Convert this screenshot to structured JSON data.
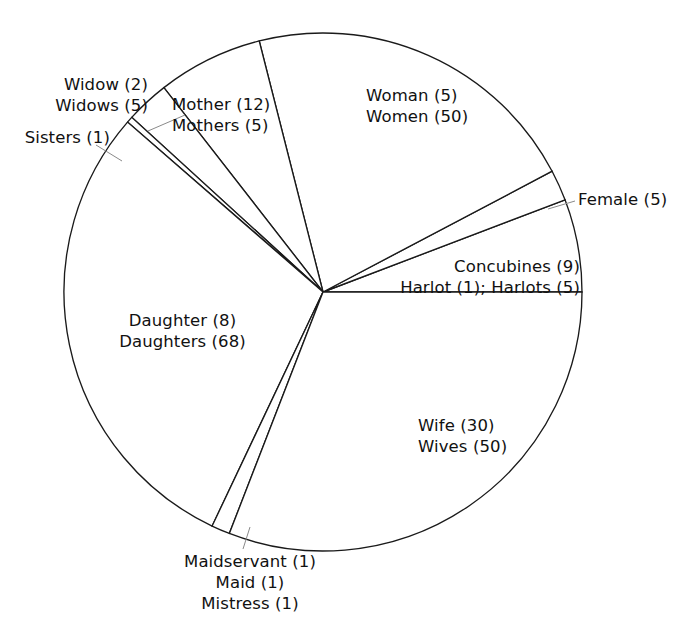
{
  "chart_data": {
    "type": "pie",
    "title": "",
    "subtitle": "",
    "xlabel": "",
    "ylabel": "",
    "legend_position": "none",
    "grid": false,
    "total": 259,
    "units": "occurrences",
    "center": {
      "x": 323,
      "y": 292
    },
    "radius": 259,
    "start_angle_deg": 0,
    "direction": "counterclockwise",
    "categories": [
      "Harlot (1); Harlots (5) + Concubines (9)",
      "Female (5)",
      "Woman (5) / Women (50)",
      "Mother (12) / Mothers (5)",
      "Widow (2) / Widows (5)",
      "Sisters (1)",
      "Daughter (8) / Daughters (68)",
      "Maidservant (1) / Maid (1) / Mistress (1)",
      "Wife (30) / Wives (50)"
    ],
    "values": [
      15,
      5,
      55,
      17,
      7,
      1,
      76,
      3,
      80
    ],
    "slices": [
      {
        "id": "concubines-harlots",
        "label_lines": [
          "Concubines (9)",
          "Harlot (1); Harlots (5)"
        ],
        "terms": [
          {
            "term": "Concubines",
            "count": 9
          },
          {
            "term": "Harlot",
            "count": 1
          },
          {
            "term": "Harlots",
            "count": 5
          }
        ],
        "value": 15,
        "percent": 5.8,
        "start_deg": 0,
        "end_deg": 20.85,
        "label_placement": "inside-right"
      },
      {
        "id": "female",
        "label_lines": [
          "Female (5)"
        ],
        "terms": [
          {
            "term": "Female",
            "count": 5
          }
        ],
        "value": 5,
        "percent": 1.9,
        "start_deg": 20.85,
        "end_deg": 27.8,
        "label_placement": "outside-right-with-leader"
      },
      {
        "id": "woman-women",
        "label_lines": [
          "Woman (5)",
          "Women (50)"
        ],
        "terms": [
          {
            "term": "Woman",
            "count": 5
          },
          {
            "term": "Women",
            "count": 50
          }
        ],
        "value": 55,
        "percent": 21.2,
        "start_deg": 27.8,
        "end_deg": 104.25,
        "label_placement": "inside-upper-right"
      },
      {
        "id": "mother-mothers",
        "label_lines": [
          "Mother (12)",
          "Mothers (5)"
        ],
        "terms": [
          {
            "term": "Mother",
            "count": 12
          },
          {
            "term": "Mothers",
            "count": 5
          }
        ],
        "value": 17,
        "percent": 6.6,
        "start_deg": 104.25,
        "end_deg": 127.9,
        "label_placement": "inside-upper"
      },
      {
        "id": "widow-widows",
        "label_lines": [
          "Widow (2)",
          "Widows (5)"
        ],
        "terms": [
          {
            "term": "Widow",
            "count": 2
          },
          {
            "term": "Widows",
            "count": 5
          }
        ],
        "value": 7,
        "percent": 2.7,
        "start_deg": 127.9,
        "end_deg": 137.6,
        "label_placement": "outside-upper-left-with-leader"
      },
      {
        "id": "sisters",
        "label_lines": [
          "Sisters (1)"
        ],
        "terms": [
          {
            "term": "Sisters",
            "count": 1
          }
        ],
        "value": 1,
        "percent": 0.4,
        "start_deg": 137.6,
        "end_deg": 139.0,
        "label_placement": "outside-left-with-leader"
      },
      {
        "id": "daughter-daughters",
        "label_lines": [
          "Daughter (8)",
          "Daughters (68)"
        ],
        "terms": [
          {
            "term": "Daughter",
            "count": 8
          },
          {
            "term": "Daughters",
            "count": 68
          }
        ],
        "value": 76,
        "percent": 29.3,
        "start_deg": 139.0,
        "end_deg": 244.65,
        "label_placement": "inside-left"
      },
      {
        "id": "maidservant-maid-mistress",
        "label_lines": [
          "Maidservant (1)",
          "Maid (1)",
          "Mistress (1)"
        ],
        "terms": [
          {
            "term": "Maidservant",
            "count": 1
          },
          {
            "term": "Maid",
            "count": 1
          },
          {
            "term": "Mistress",
            "count": 1
          }
        ],
        "value": 3,
        "percent": 1.2,
        "start_deg": 244.65,
        "end_deg": 248.8,
        "label_placement": "outside-bottom-with-leader"
      },
      {
        "id": "wife-wives",
        "label_lines": [
          "Wife (30)",
          "Wives (50)"
        ],
        "terms": [
          {
            "term": "Wife",
            "count": 30
          },
          {
            "term": "Wives",
            "count": 50
          }
        ],
        "value": 80,
        "percent": 30.9,
        "start_deg": 248.8,
        "end_deg": 360,
        "label_placement": "inside-lower-right"
      }
    ],
    "colors": {
      "slice_fill": "#ffffff",
      "slice_stroke": "#1a1a1a",
      "leader_line": "#8a8a8a",
      "label_text": "#111111",
      "background": "#ffffff"
    }
  },
  "labels": {
    "widow": {
      "line1": "Widow (2)",
      "line2": "Widows (5)"
    },
    "sisters": {
      "line1": "Sisters (1)"
    },
    "mother": {
      "line1": "Mother (12)",
      "line2": "Mothers (5)"
    },
    "woman": {
      "line1": "Woman (5)",
      "line2": "Women (50)"
    },
    "female": {
      "line1": "Female (5)"
    },
    "concubines": {
      "line1": "Concubines (9)",
      "line2": "Harlot (1); Harlots (5)"
    },
    "wife": {
      "line1": "Wife (30)",
      "line2": "Wives (50)"
    },
    "daughter": {
      "line1": "Daughter (8)",
      "line2": "Daughters (68)"
    },
    "maid": {
      "line1": "Maidservant (1)",
      "line2": "Maid (1)",
      "line3": "Mistress (1)"
    }
  }
}
